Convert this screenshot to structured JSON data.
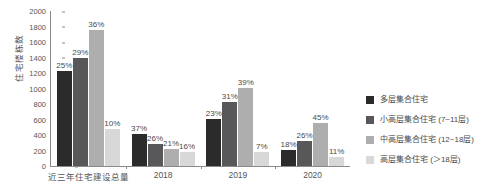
{
  "chart_data": {
    "type": "bar",
    "title": "",
    "xlabel": "",
    "ylabel": "住宅楼栋数",
    "ylim": [
      0,
      2000
    ],
    "ytick_step": 200,
    "yticks": [
      "0",
      "200",
      "400",
      "600",
      "800",
      "1000",
      "1200",
      "1400",
      "1600",
      "1800",
      "2000"
    ],
    "grid": false,
    "legend_position": "right",
    "categories": [
      "近三年住宅建设总量",
      "2018",
      "2019",
      "2020"
    ],
    "series": [
      {
        "name": "多层集合住宅",
        "color": "#2b2b2b",
        "values": [
          1220,
          415,
          605,
          205
        ],
        "labels": [
          "25%",
          "37%",
          "23%",
          "18%"
        ]
      },
      {
        "name": "小高层集合住宅（7~11层）",
        "color": "#58585a",
        "values": [
          1400,
          290,
          825,
          320
        ],
        "labels": [
          "29%",
          "26%",
          "31%",
          "26%"
        ]
      },
      {
        "name": "中高层集合住宅（12~18层）",
        "color": "#aeaeae",
        "values": [
          1760,
          225,
          1010,
          555
        ],
        "labels": [
          "36%",
          "21%",
          "39%",
          "45%"
        ]
      },
      {
        "name": "高层集合住宅（＞18层）",
        "color": "#d8d8d8",
        "values": [
          480,
          175,
          180,
          120
        ],
        "labels": [
          "10%",
          "16%",
          "7%",
          "11%"
        ]
      }
    ]
  },
  "axis": {
    "y_title": "住宅楼栋数",
    "y_tick_labels": [
      "2000",
      "1800",
      "1600",
      "1400",
      "1200",
      "1000",
      "800",
      "600",
      "400",
      "200",
      "0"
    ],
    "x_tick_labels": [
      "近三年住宅建设总量",
      "2018",
      "2019",
      "2020"
    ]
  },
  "legend": {
    "items": [
      {
        "label": "多层集合住宅",
        "color": "#2b2b2b"
      },
      {
        "label": "小高层集合住宅 (7~11层)",
        "color": "#58585a"
      },
      {
        "label": "中高层集合住宅 (12~18层)",
        "color": "#aeaeae"
      },
      {
        "label": "高层集合住宅 (＞18层)",
        "color": "#d8d8d8"
      }
    ]
  },
  "value_labels": {
    "g0": [
      "25%",
      "29%",
      "36%",
      "10%"
    ],
    "g1": [
      "37%",
      "26%",
      "21%",
      "16%"
    ],
    "g2": [
      "23%",
      "31%",
      "39%",
      "7%"
    ],
    "g3": [
      "18%",
      "26%",
      "45%",
      "11%"
    ]
  }
}
